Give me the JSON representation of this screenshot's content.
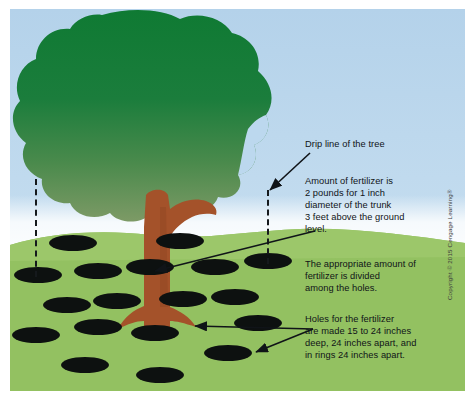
{
  "figure": {
    "copyright": "Copyright © 2015 Cengage Learning®"
  },
  "palette": {
    "sky_top": "#b4d2ea",
    "sky_bottom": "#d8e8f4",
    "grass": "#93c161",
    "grass_shade": "#86b657",
    "canopy_dark": "#13793a",
    "canopy_light": "#6d8f5e",
    "trunk": "#a4522a",
    "hole": "#0d1110",
    "ink": "#101418"
  },
  "annotations": [
    {
      "id": "drip-line",
      "text": "Drip line of the tree"
    },
    {
      "id": "amount",
      "text": "Amount of fertilizer is\n2 pounds for 1 inch\ndiameter of the trunk\n3 feet above the ground\nlevel."
    },
    {
      "id": "divided",
      "text": "The appropriate amount of\nfertilizer is divided\namong the holes."
    },
    {
      "id": "holes",
      "text": "Holes for the fertilizer\nare made 15 to 24 inches\ndeep, 24 inches apart, and\nin rings 24 inches apart."
    }
  ],
  "scene": {
    "sky_label": "sky",
    "ground_label": "lawn",
    "tree_label": "shade tree",
    "drip_line_left_label": "left drip line marker",
    "drip_line_right_label": "right drip line marker"
  },
  "diagram_data": {
    "type": "illustration",
    "holes_count": 19,
    "hole_positions": [
      [
        63,
        16
      ],
      [
        113,
        12
      ],
      [
        163,
        8
      ],
      [
        28,
        48
      ],
      [
        78,
        44
      ],
      [
        128,
        40
      ],
      [
        178,
        36
      ],
      [
        228,
        32
      ],
      [
        50,
        78
      ],
      [
        100,
        74
      ],
      [
        150,
        70
      ],
      [
        200,
        66
      ],
      [
        248,
        62
      ],
      [
        22,
        108
      ],
      [
        72,
        104
      ],
      [
        122,
        100
      ],
      [
        172,
        96
      ],
      [
        95,
        134
      ],
      [
        145,
        130
      ]
    ],
    "leader_arrows": [
      {
        "from": [
          302,
          150
        ],
        "to": [
          262,
          187
        ],
        "target": "drip-line-right"
      },
      {
        "from": [
          306,
          224
        ],
        "to": [
          143,
          264
        ],
        "target": "fertilizer-holes-area"
      },
      {
        "from": [
          304,
          322
        ],
        "to": [
          182,
          319
        ],
        "target": "hole-left"
      },
      {
        "from": [
          304,
          322
        ],
        "to": [
          243,
          344
        ],
        "target": "hole-right"
      }
    ]
  }
}
